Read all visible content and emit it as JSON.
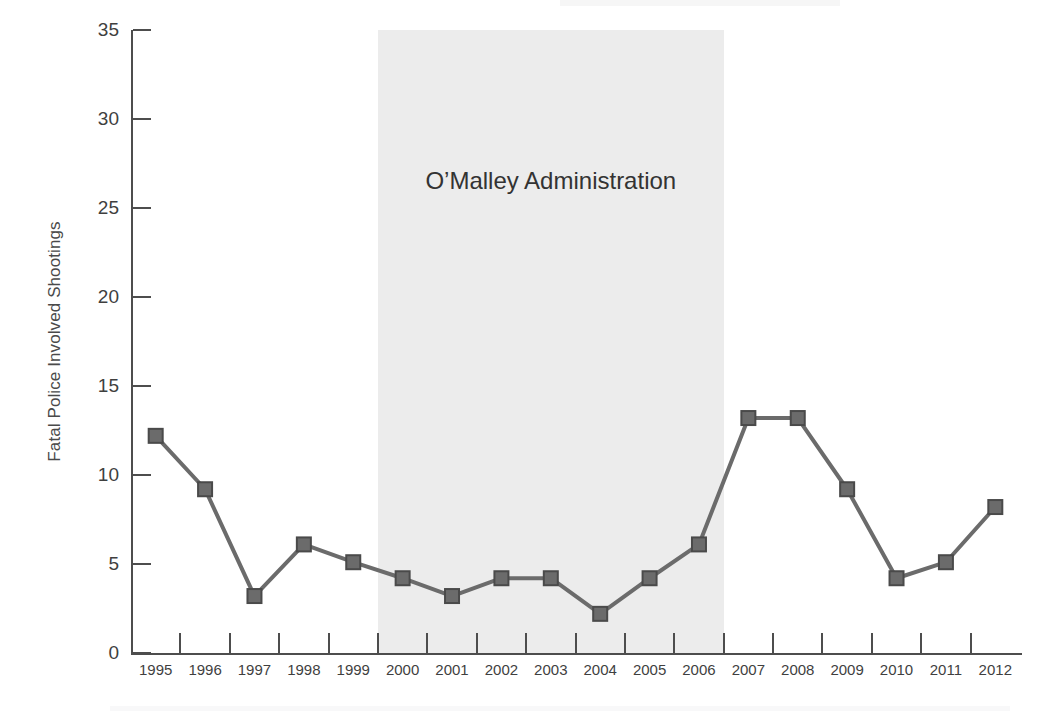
{
  "chart_data": {
    "type": "line",
    "title": "",
    "xlabel": "",
    "ylabel": "Fatal Police Involved Shootings",
    "categories": [
      "1995",
      "1996",
      "1997",
      "1998",
      "1999",
      "2000",
      "2001",
      "2002",
      "2003",
      "2004",
      "2005",
      "2006",
      "2007",
      "2008",
      "2009",
      "2010",
      "2011",
      "2012"
    ],
    "values": [
      12.2,
      9.2,
      3.2,
      6.1,
      5.1,
      4.2,
      3.2,
      4.2,
      4.2,
      2.2,
      4.2,
      6.1,
      13.2,
      13.2,
      9.2,
      4.2,
      5.1,
      8.2
    ],
    "ylim": [
      0,
      35
    ],
    "y_ticks": [
      0,
      5,
      10,
      15,
      20,
      25,
      30,
      35
    ],
    "y_tick_labels": [
      "0",
      "5",
      "10",
      "15",
      "20",
      "25",
      "30",
      "35"
    ],
    "grid": false,
    "legend": "none",
    "marker": "square",
    "series_color": "#6b6b6b",
    "annotations": [
      {
        "text": "O’Malley Administration",
        "type": "shaded-span",
        "start_category": "2000",
        "end_category": "2006",
        "band_color": "#ececec"
      }
    ]
  },
  "axes": {
    "y_title": "Fatal Police Involved Shootings",
    "axis_color": "#4d4d4d"
  },
  "annotation": {
    "band_label": "O’Malley Administration"
  }
}
